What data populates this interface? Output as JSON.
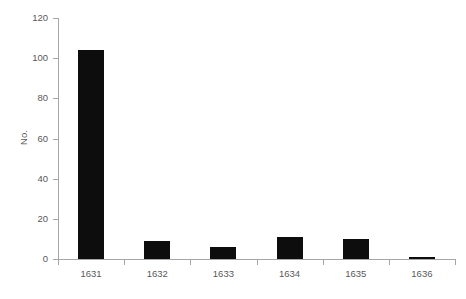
{
  "chart_data": {
    "type": "bar",
    "title": "",
    "subtitle": "",
    "xlabel": "",
    "ylabel": "No.",
    "categories": [
      "1631",
      "1632",
      "1633",
      "1634",
      "1635",
      "1636"
    ],
    "values": [
      104,
      9,
      6,
      11,
      10,
      1
    ],
    "series": [
      {
        "name": "No.",
        "values": [
          104,
          9,
          6,
          11,
          10,
          1
        ]
      }
    ],
    "ylim": [
      0,
      120
    ],
    "ytick_values": [
      0,
      20,
      40,
      60,
      80,
      100,
      120
    ],
    "ytick_labels": [
      "0",
      "20",
      "40",
      "60",
      "80",
      "100",
      "120"
    ],
    "xtick_labels": [
      "1631",
      "1632",
      "1633",
      "1634",
      "1635",
      "1636"
    ],
    "grid": false,
    "legend": false,
    "legend_position": "none",
    "bar_color": "#0d0d0d",
    "axis_color": "#a6a6a6",
    "tick_label_color": "#595959"
  }
}
